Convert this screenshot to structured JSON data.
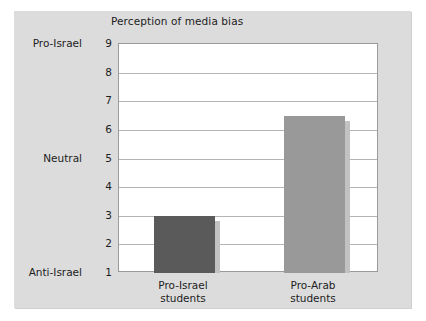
{
  "chart_data": {
    "type": "bar",
    "title": "Perception of media bias",
    "xlabel": "",
    "ylabel": "",
    "categories": [
      "Pro-Israel students",
      "Pro-Arab students"
    ],
    "category_lines": [
      [
        "Pro-Israel",
        "students"
      ],
      [
        "Pro-Arab",
        "students"
      ]
    ],
    "values": [
      3.0,
      6.5
    ],
    "ylim": [
      1,
      9
    ],
    "yticks": [
      9,
      8,
      7,
      6,
      5,
      4,
      3,
      2,
      1
    ],
    "ytick_labels": [
      "9",
      "8",
      "7",
      "6",
      "5",
      "4",
      "3",
      "2",
      "1"
    ],
    "y_anchor_labels": [
      {
        "value": 9,
        "label": "Pro-Israel"
      },
      {
        "value": 5,
        "label": "Neutral"
      },
      {
        "value": 1,
        "label": "Anti-Israel"
      }
    ],
    "grid": true,
    "legend": false,
    "bar_colors": [
      "#5a5a5a",
      "#999999"
    ],
    "plot_background": "#ffffff",
    "panel_background": "#dcdcdc",
    "axis_color": "#9a9a9a",
    "grid_color": "#b5b5b5",
    "text_color": "#1d1d1d"
  }
}
